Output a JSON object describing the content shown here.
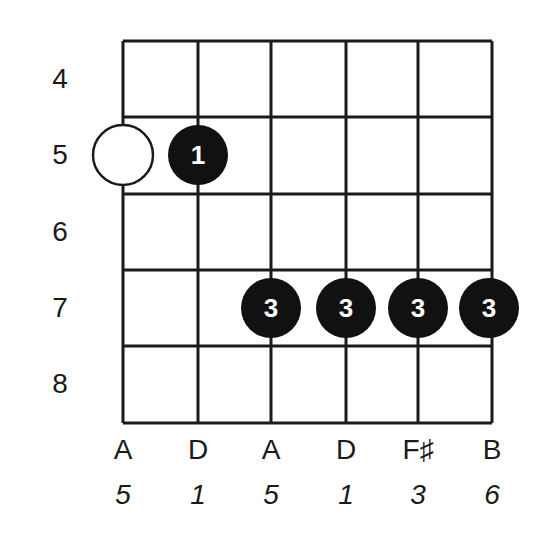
{
  "diagram": {
    "type": "guitar-chord-chart",
    "frets": [
      "4",
      "5",
      "6",
      "7",
      "8"
    ],
    "strings": [
      {
        "note": "A",
        "interval": "5"
      },
      {
        "note": "D",
        "interval": "1"
      },
      {
        "note": "A",
        "interval": "5"
      },
      {
        "note": "D",
        "interval": "1"
      },
      {
        "note": "F♯",
        "interval": "3"
      },
      {
        "note": "B",
        "interval": "6"
      }
    ],
    "markers": [
      {
        "string": 1,
        "fret": "5",
        "style": "open-circle",
        "label": ""
      },
      {
        "string": 2,
        "fret": "5",
        "style": "filled",
        "label": "1"
      },
      {
        "string": 3,
        "fret": "7",
        "style": "filled",
        "label": "3"
      },
      {
        "string": 4,
        "fret": "7",
        "style": "filled",
        "label": "3"
      },
      {
        "string": 5,
        "fret": "7",
        "style": "filled",
        "label": "3"
      },
      {
        "string": 6,
        "fret": "7",
        "style": "filled",
        "label": "3"
      }
    ],
    "colors": {
      "line": "#1a1a1a",
      "dot": "#111111",
      "dot_text": "#ffffff",
      "background": "#ffffff"
    }
  }
}
